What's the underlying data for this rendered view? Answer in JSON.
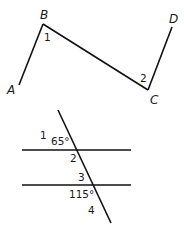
{
  "figure1": {
    "points": {
      "A": {
        "label": "A",
        "x": 19,
        "y": 85
      },
      "B": {
        "label": "B",
        "x": 43,
        "y": 24
      },
      "C": {
        "label": "C",
        "x": 148,
        "y": 90
      },
      "D": {
        "label": "D",
        "x": 172,
        "y": 27
      }
    },
    "angles": {
      "angle1": {
        "label": "1"
      },
      "angle2": {
        "label": "2"
      }
    }
  },
  "figure2": {
    "angles": {
      "angle1": {
        "label": "1"
      },
      "angle1_measure": {
        "label": "65°"
      },
      "angle2": {
        "label": "2"
      },
      "angle3": {
        "label": "3"
      },
      "angle_bottom_measure": {
        "label": "115°"
      },
      "angle4": {
        "label": "4"
      }
    }
  },
  "colors": {
    "stroke": "#111111",
    "text": "#1a1a1a"
  }
}
